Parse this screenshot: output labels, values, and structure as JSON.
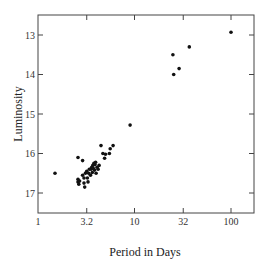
{
  "chart_data": {
    "type": "scatter",
    "title": "",
    "xlabel": "Period in Days",
    "ylabel": "Luminosity",
    "x_scale": "log",
    "y_inverted": true,
    "xlim": [
      1,
      130
    ],
    "ylim": [
      17.5,
      12.5
    ],
    "x_ticks": [
      1,
      3.2,
      10,
      32,
      100
    ],
    "x_tick_labels": [
      "1",
      "3.2",
      "10",
      "32",
      "100"
    ],
    "y_ticks": [
      13,
      14,
      15,
      16,
      17
    ],
    "y_tick_labels": [
      "13",
      "14",
      "15",
      "16",
      "17"
    ],
    "grid": false,
    "legend": null,
    "points": [
      {
        "x": 1.5,
        "y": 16.5
      },
      {
        "x": 2.6,
        "y": 16.1
      },
      {
        "x": 2.9,
        "y": 16.18
      },
      {
        "x": 2.6,
        "y": 16.65
      },
      {
        "x": 2.6,
        "y": 16.72
      },
      {
        "x": 2.65,
        "y": 16.78
      },
      {
        "x": 2.7,
        "y": 16.7
      },
      {
        "x": 2.9,
        "y": 16.55
      },
      {
        "x": 3.0,
        "y": 16.62
      },
      {
        "x": 3.0,
        "y": 16.75
      },
      {
        "x": 3.05,
        "y": 16.85
      },
      {
        "x": 3.1,
        "y": 16.5
      },
      {
        "x": 3.2,
        "y": 16.45
      },
      {
        "x": 3.25,
        "y": 16.62
      },
      {
        "x": 3.3,
        "y": 16.72
      },
      {
        "x": 3.35,
        "y": 16.5
      },
      {
        "x": 3.4,
        "y": 16.4
      },
      {
        "x": 3.5,
        "y": 16.55
      },
      {
        "x": 3.55,
        "y": 16.4
      },
      {
        "x": 3.6,
        "y": 16.35
      },
      {
        "x": 3.65,
        "y": 16.48
      },
      {
        "x": 3.7,
        "y": 16.3
      },
      {
        "x": 3.75,
        "y": 16.38
      },
      {
        "x": 3.8,
        "y": 16.25
      },
      {
        "x": 3.85,
        "y": 16.42
      },
      {
        "x": 3.9,
        "y": 16.28
      },
      {
        "x": 3.95,
        "y": 16.22
      },
      {
        "x": 4.0,
        "y": 16.5
      },
      {
        "x": 4.1,
        "y": 16.35
      },
      {
        "x": 4.2,
        "y": 16.4
      },
      {
        "x": 4.3,
        "y": 16.3
      },
      {
        "x": 4.5,
        "y": 15.8
      },
      {
        "x": 4.7,
        "y": 16.0
      },
      {
        "x": 4.9,
        "y": 16.12
      },
      {
        "x": 5.0,
        "y": 16.02
      },
      {
        "x": 5.5,
        "y": 16.0
      },
      {
        "x": 5.6,
        "y": 15.88
      },
      {
        "x": 6.0,
        "y": 15.8
      },
      {
        "x": 9.0,
        "y": 15.28
      },
      {
        "x": 25.0,
        "y": 13.5
      },
      {
        "x": 25.5,
        "y": 14.0
      },
      {
        "x": 29.0,
        "y": 13.85
      },
      {
        "x": 37.0,
        "y": 13.3
      },
      {
        "x": 100.0,
        "y": 12.93
      }
    ]
  }
}
